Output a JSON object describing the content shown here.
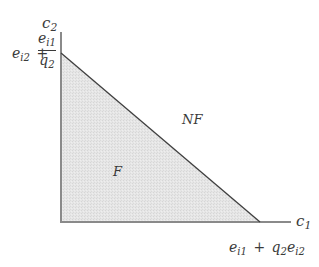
{
  "diagram": {
    "type": "feasibility-region",
    "axes": {
      "x_label": "c",
      "x_label_sub": "1",
      "y_label": "c",
      "y_label_sub": "2"
    },
    "y_intercept_label": {
      "lead": "e",
      "lead_sub": "i2",
      "plus": "+",
      "numerator": "e",
      "numerator_sub": "i1",
      "denominator": "q",
      "denominator_sub": "2"
    },
    "x_intercept_label": {
      "a": "e",
      "a_sub": "i1",
      "plus": "+",
      "b": "q",
      "b_sub": "2",
      "c": "e",
      "c_sub": "i2"
    },
    "regions": {
      "feasible": "F",
      "not_feasible": "NF"
    },
    "colors": {
      "region_fill": "#e4e4e4",
      "axis": "#8a8a8a",
      "boundary": "#3f3f3f",
      "text": "#3a3a3a"
    }
  }
}
